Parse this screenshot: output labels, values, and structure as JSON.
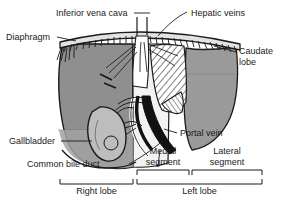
{
  "figure": {
    "type": "anatomical-diagram",
    "colors": {
      "ink": "#1a1a1a",
      "liver_fill_dark": "#8c8c8c",
      "liver_fill_mid": "#a8a8a8",
      "liver_fill_light": "#d6d6d6",
      "vessel_dark": "#111111",
      "vessel_light": "#ffffff",
      "background": "#ffffff"
    }
  },
  "labels": {
    "inferior_vena_cava": "Inferior vena cava",
    "hepatic_veins": "Hepatic veins",
    "diaphragm": "Diaphragm",
    "caudate_lobe_line1": "Caudate",
    "caudate_lobe_line2": "lobe",
    "gallbladder": "Gallbladder",
    "portal_vein": "Portal vein",
    "common_bile_duct": "Common bile duct",
    "medial_segment_line1": "Medial",
    "medial_segment_line2": "segment",
    "lateral_segment_line1": "Lateral",
    "lateral_segment_line2": "segment",
    "right_lobe": "Right lobe",
    "left_lobe": "Left lobe"
  },
  "brackets": [
    {
      "name": "medial-segment-bracket",
      "label": "Medial segment",
      "x1": 137,
      "x2": 189,
      "y": 171
    },
    {
      "name": "lateral-segment-bracket",
      "label": "Lateral segment",
      "x1": 192,
      "x2": 262,
      "y": 171
    },
    {
      "name": "right-lobe-bracket",
      "label": "Right lobe",
      "x1": 60,
      "x2": 133,
      "y": 180
    },
    {
      "name": "left-lobe-bracket",
      "label": "Left lobe",
      "x1": 137,
      "x2": 262,
      "y": 180
    }
  ],
  "structures": [
    "Inferior vena cava",
    "Hepatic veins",
    "Diaphragm",
    "Caudate lobe",
    "Gallbladder",
    "Portal vein",
    "Common bile duct",
    "Medial segment",
    "Lateral segment",
    "Right lobe",
    "Left lobe"
  ]
}
